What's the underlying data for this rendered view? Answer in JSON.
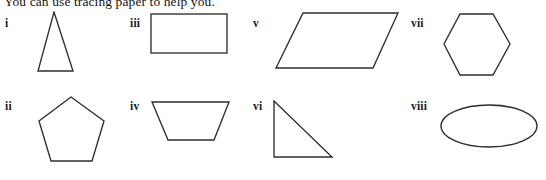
{
  "instruction": "You can use tracing paper to help you.",
  "canvas": {
    "width": 546,
    "height": 180,
    "background": "#ffffff",
    "stroke_color": "#2e2e2e"
  },
  "shapes": [
    {
      "label": "i",
      "name": "triangle",
      "description": "isosceles triangle",
      "label_x": 5,
      "label_y": 17,
      "svg_x": 36,
      "svg_y": 11,
      "svg_w": 76,
      "svg_h": 64,
      "geometry": "polygon",
      "points": "37,60 18,1 2,60"
    },
    {
      "label": "ii",
      "name": "pentagon",
      "description": "regular pentagon",
      "label_x": 5,
      "label_y": 100,
      "svg_x": 36,
      "svg_y": 95,
      "svg_w": 76,
      "svg_h": 76,
      "geometry": "polygon",
      "points": "35,2 68,26 56,66 15,66 3,26"
    },
    {
      "label": "iii",
      "name": "rectangle",
      "description": "rectangle",
      "label_x": 130,
      "label_y": 17,
      "svg_x": 148,
      "svg_y": 11,
      "svg_w": 86,
      "svg_h": 50,
      "geometry": "rect",
      "points": "3,3 76,39"
    },
    {
      "label": "iv",
      "name": "trapezium",
      "description": "trapezium with longer top edge",
      "label_x": 130,
      "label_y": 100,
      "svg_x": 148,
      "svg_y": 95,
      "svg_w": 90,
      "svg_h": 60,
      "geometry": "polygon",
      "points": "4,7 81,7 66,45 20,45"
    },
    {
      "label": "v",
      "name": "parallelogram",
      "description": "parallelogram slanting right",
      "label_x": 253,
      "label_y": 17,
      "svg_x": 272,
      "svg_y": 8,
      "svg_w": 132,
      "svg_h": 68,
      "geometry": "polygon",
      "points": "31,5 126,5 101,60 4,60"
    },
    {
      "label": "vi",
      "name": "right-triangle",
      "description": "right-angled triangle, right angle bottom-left",
      "label_x": 253,
      "label_y": 100,
      "svg_x": 268,
      "svg_y": 95,
      "svg_w": 84,
      "svg_h": 72,
      "geometry": "polygon",
      "points": "6,6 64,62 6,62"
    },
    {
      "label": "vii",
      "name": "hexagon",
      "description": "regular hexagon, flat top",
      "label_x": 411,
      "label_y": 17,
      "svg_x": 441,
      "svg_y": 10,
      "svg_w": 78,
      "svg_h": 74,
      "geometry": "polygon",
      "points": "19,4 52,4 69,34 52,65 19,65 3,34"
    },
    {
      "label": "viii",
      "name": "ellipse",
      "description": "oval / ellipse",
      "label_x": 411,
      "label_y": 100,
      "svg_x": 436,
      "svg_y": 98,
      "svg_w": 106,
      "svg_h": 58,
      "geometry": "ellipse",
      "points": "53,28 48,21"
    }
  ]
}
